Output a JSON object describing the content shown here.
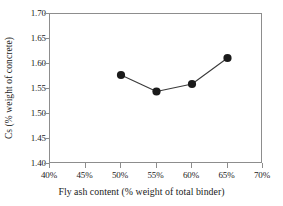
{
  "chart_data": {
    "type": "line",
    "title": "",
    "subtitle": "",
    "xlabel": "Fly ash content (% weight of total binder)",
    "ylabel": "Cs (% weight of concrete)",
    "x": [
      50,
      55,
      60,
      65
    ],
    "values": [
      1.578,
      1.545,
      1.56,
      1.612
    ],
    "series": [
      {
        "name": "Cs",
        "x": [
          50,
          55,
          60,
          65
        ],
        "values": [
          1.578,
          1.545,
          1.56,
          1.612
        ],
        "marker": "filled-circle",
        "marker_color": "#1a1a1a",
        "line_color": "#3a3a3a"
      }
    ],
    "xlim": [
      40,
      70
    ],
    "ylim": [
      1.4,
      1.7
    ],
    "xticks": [
      40,
      45,
      50,
      55,
      60,
      65,
      70
    ],
    "yticks": [
      1.4,
      1.45,
      1.5,
      1.55,
      1.6,
      1.65,
      1.7
    ],
    "xtick_labels": [
      "40%",
      "45%",
      "50%",
      "55%",
      "60%",
      "65%",
      "70%"
    ],
    "ytick_labels": [
      "1.40",
      "1.45",
      "1.50",
      "1.55",
      "1.60",
      "1.65",
      "1.70"
    ],
    "grid": false,
    "legend": false,
    "legend_position": "none",
    "annotations": []
  },
  "colors": {
    "axis": "#8d8d8d",
    "marker": "#1a1a1a",
    "line": "#3a3a3a",
    "text": "#1a1a1a",
    "background": "#ffffff"
  }
}
